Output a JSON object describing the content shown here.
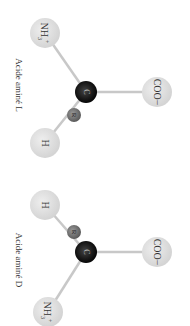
{
  "molecules": [
    {
      "name": "L",
      "label": "Acide aminé L",
      "atoms": {
        "amine": {
          "text": "NH3+",
          "main": "NH",
          "sub": "3",
          "sup": "+"
        },
        "carbon": {
          "text": "C"
        },
        "r_group": {
          "text": "R"
        },
        "carboxyl": {
          "text": "COO−"
        },
        "hydrogen": {
          "text": "H"
        }
      }
    },
    {
      "name": "D",
      "label": "Acide aminé D",
      "atoms": {
        "amine": {
          "text": "NH3+",
          "main": "NH",
          "sub": "3",
          "sup": "+"
        },
        "carbon": {
          "text": "C"
        },
        "r_group": {
          "text": "R"
        },
        "carboxyl": {
          "text": "COO−"
        },
        "hydrogen": {
          "text": "H"
        }
      }
    }
  ],
  "colors": {
    "ligand_sphere": "#dcdcdc",
    "carbon_sphere": "#1a1a1a",
    "r_sphere": "#6e6e6e",
    "bond": "#c8c8c8"
  }
}
